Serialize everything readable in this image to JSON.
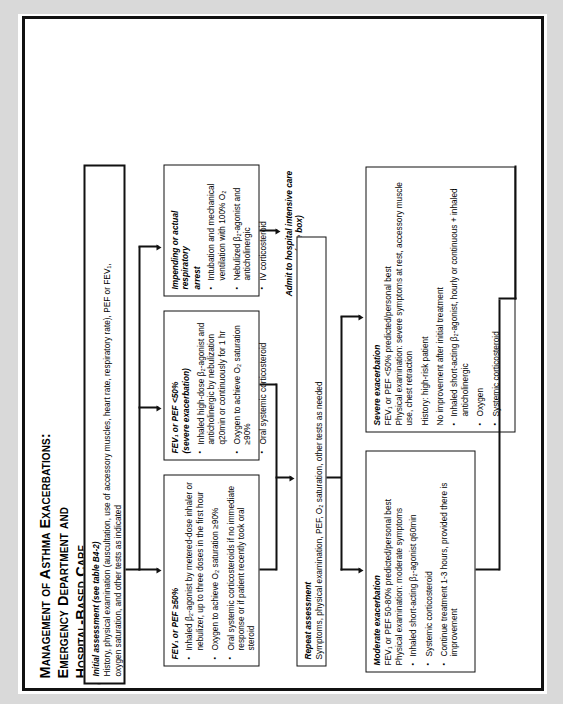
{
  "document": {
    "title_line1": "Management of Asthma Exacerbations:  Emergency Department and",
    "title_line2": "Hospital-Based Care"
  },
  "initial_assessment": {
    "heading": "Initial assessment (see table B4-2)",
    "line1": "History, physical examination (auscultation, use of accessory muscles, heart rate, respiratory rate), PEF or FEV₁,",
    "line2": "oxygen saturation, and other tests as indicated"
  },
  "branch_mild": {
    "heading": "FEV₁ or PEF ≥50%",
    "bullets": [
      "Inhaled β₂-agonist by metered-dose inhaler or nebulizer, up to three doses in the first hour",
      "Oxygen to achieve O₂ saturation ≥90%",
      "Oral systemic corticosteroids if no immediate response or if patient recently took oral steroid"
    ]
  },
  "branch_severe": {
    "heading": "FEV₁ or PEF <50%",
    "subheading": "(severe exacerbation)",
    "bullets": [
      "Inhaled high-dose β₂-agonist and anticholinergic by nebulization q20min or continuously for 1 hr",
      "Oxygen to achieve O₂ saturation ≥90%",
      "Oral systemic corticosteroid"
    ]
  },
  "branch_arrest": {
    "heading": "Impending or actual respiratory",
    "heading2": "arrest",
    "bullets": [
      "Intubation and mechanical ventilation with 100% O₂",
      "Nebulized β₂-agonist and anticholinergic",
      "IV corticosteroid"
    ]
  },
  "admit_icu": {
    "line1": "Admit to hospital intensive care",
    "line2": "(see box)"
  },
  "repeat_assessment": {
    "heading": "Repeat assessment",
    "line1": "Symptoms, physical examination, PEF, O₂ saturation, other tests as needed"
  },
  "moderate_exacerbation": {
    "heading": "Moderate exacerbation",
    "line1": "FEV₁ or PEF 50-80% predicted/personal best",
    "line2": "Physical examination: moderate symptoms",
    "bullets": [
      "Inhaled short-acting β₂-agonist q60min",
      "Systemic corticosteroid",
      "Continue treatment 1-3 hours, provided there is improvement"
    ]
  },
  "severe_exacerbation": {
    "heading": "Severe exacerbation",
    "line1": "FEV₁ or PEF <50% predicted/personal best",
    "line2": "Physical examination: severe symptoms at rest, accessory muscle use, chest retraction",
    "line3": "History: high-risk patient",
    "line4": "No improvement after initial treatment",
    "bullets": [
      "Inhaled short-acting β₂-agonist, hourly or continuous + inhaled anticholinergic",
      "Oxygen",
      "Systemic corticosteroid"
    ]
  },
  "colors": {
    "ink": "#111111",
    "paper": "#ffffff",
    "scan_edge": "#d9d9d9"
  }
}
